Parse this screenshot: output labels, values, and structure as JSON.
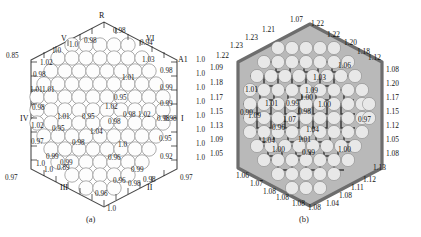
{
  "figure": {
    "panels": [
      {
        "id": "a",
        "caption": "(a)",
        "description": "line-drawing hexagonal lattice with fuel pin circles and relative power values"
      },
      {
        "id": "b",
        "caption": "(b)",
        "description": "shaded hexagonal lattice with fuel pin circles and relative power values"
      }
    ]
  },
  "panel_a": {
    "caption": "(a)",
    "corner_labels": {
      "apex_top": "R",
      "upper_left": "V",
      "upper_right": "VI",
      "left": "IV",
      "right": "I",
      "lower_left": "III",
      "lower_right": "II",
      "right_axis": "A1"
    },
    "corner_values": {
      "top_left": "0.85",
      "bottom_left": "0.97",
      "bottom_right": "0.97",
      "bottom_apex": "1.0"
    },
    "edge_top_left": [
      "1.02",
      "1.0",
      "1.0"
    ],
    "edge_top_right": [
      "0.98",
      "0.98",
      "0.94",
      "1.03"
    ],
    "edge_left": [
      "0.98",
      "1.01",
      "1.01",
      "0.98",
      "1.02",
      "0.97",
      "1.0"
    ],
    "edge_right": [
      "0.98",
      "0.99",
      "0.99",
      "0.98",
      "0.98",
      "0.95",
      "0.92"
    ],
    "edge_bottom_left": [
      "0.99",
      "1.0",
      "0.99",
      "0.96"
    ],
    "edge_bottom_right": [
      "0.99",
      "0.98",
      "0.98",
      "0.96"
    ],
    "right_column": [
      "1.0",
      "1.0",
      "1.0",
      "1.0",
      "1.0",
      "1.0",
      "1.0",
      "1.0"
    ],
    "interior": [
      "1.01",
      "0.95",
      "1.02",
      "0.98",
      "1.02",
      "1.01",
      "0.95",
      "0.98",
      "1.04",
      "0.98",
      "0.95",
      "1.0",
      "0.96",
      "0.89"
    ]
  },
  "panel_b": {
    "caption": "(b)",
    "edge_top": [
      "1.23",
      "1.23",
      "1.21",
      "1.07",
      "1.22",
      "1.22",
      "1.20",
      "1.18"
    ],
    "edge_left": [
      "1.22",
      "1.09",
      "1.18",
      "1.17",
      "1.15",
      "1.13",
      "1.09",
      "1.05"
    ],
    "edge_right": [
      "1.12",
      "1.08",
      "1.20",
      "1.17",
      "1.15",
      "1.12",
      "1.05",
      "1.08",
      "1.13"
    ],
    "edge_bottom": [
      "1.06",
      "1.07",
      "1.08",
      "1.08",
      "1.08",
      "1.08",
      "1.04",
      "1.08",
      "1.11",
      "1.12"
    ],
    "interior": [
      "1.06",
      "1.03",
      "1.01",
      "1.09",
      "1.00",
      "1.01",
      "0.99",
      "1.00",
      "0.98",
      "0.99",
      "1.09",
      "0.97",
      "1.07",
      "0.96",
      "1.04",
      "1.04",
      "1.01",
      "1.00",
      "0.99",
      "1.00"
    ]
  },
  "colors": {
    "ink": "#1b1b1b",
    "edge_a": "#4a4a4a",
    "pin_a_fill": "#fdfdfd",
    "hex_b_fill": "#b9b9b9",
    "edge_b": "#6d6d6d",
    "pin_b_fill": "#e8e8e8",
    "lattice_b": "#3a3a3a",
    "background": "#ffffff"
  }
}
